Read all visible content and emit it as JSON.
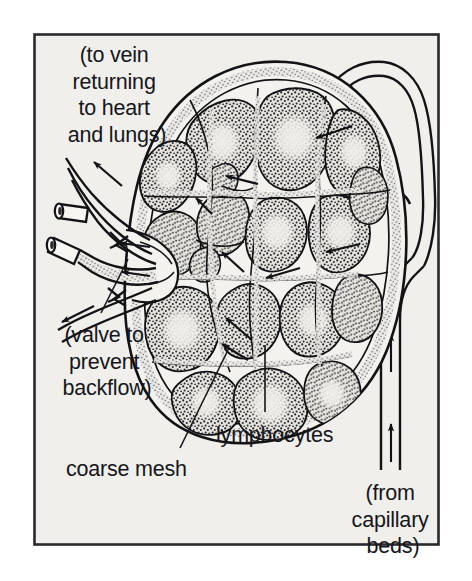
{
  "figure": {
    "frame": {
      "border_color": "#2a2a2e",
      "background_color": "#f0efec"
    },
    "colors": {
      "ink": "#16161a",
      "paper": "#f0efec",
      "stipple": "#2b2b2f",
      "nodule_fill": "#cfcdc8",
      "germinal_center": "#e8e7e3",
      "vessel_lumen": "#f6f5f2"
    }
  },
  "labels": {
    "efferent": {
      "name": "efferent-vessel-label",
      "lines": [
        "(to vein",
        "returning",
        "to heart",
        "and lungs)"
      ],
      "anchor_x": 117,
      "top_y": 45,
      "align": "middle"
    },
    "valve": {
      "name": "valve-label",
      "lines": [
        "(valve to",
        "prevent",
        "backflow)"
      ],
      "anchor_x": 107,
      "top_y": 325,
      "align": "middle"
    },
    "coarse_mesh": {
      "name": "coarse-mesh-label",
      "lines": [
        "coarse mesh"
      ],
      "anchor_x": 66,
      "top_y": 459,
      "align": "start"
    },
    "lymphocytes": {
      "name": "lymphocytes-label",
      "lines": [
        "lymphocytes"
      ],
      "anchor_x": 216,
      "top_y": 425,
      "align": "start"
    },
    "afferent": {
      "name": "afferent-vessel-label",
      "lines": [
        "(from",
        "capillary",
        "beds)"
      ],
      "anchor_x": 393,
      "top_y": 483,
      "align": "middle"
    }
  },
  "leader_lines": [
    {
      "name": "leader-valve",
      "from": [
        101,
        313
      ],
      "to": [
        128,
        259
      ]
    },
    {
      "name": "leader-coarse-mesh",
      "from": [
        180,
        448
      ],
      "to": [
        229,
        348
      ]
    },
    {
      "name": "leader-lymphocytes",
      "from": [
        265,
        412
      ],
      "to": [
        265,
        345
      ]
    }
  ],
  "flow": {
    "efferent_direction": "out-left",
    "afferent_direction": "in-from-right",
    "upward_arrow_count": 3,
    "note": "arrows in sinuses show lymph percolating from afferent vessels through the node toward the hilum and efferent vessel"
  },
  "structures": [
    {
      "name": "capsule",
      "description": "outer fibrous capsule of node"
    },
    {
      "name": "subcapsular-sinus",
      "description": "stippled channel just inside capsule"
    },
    {
      "name": "lymphoid-nodule",
      "description": "stippled lobule packed with lymphocytes",
      "count": 18
    },
    {
      "name": "germinal-center",
      "description": "pale center within nodule"
    },
    {
      "name": "medullary-sinus",
      "description": "branching white channel between nodules"
    },
    {
      "name": "hilum",
      "description": "indentation at left where efferent vessels exit"
    },
    {
      "name": "efferent-vessel",
      "description": "vessel leaving node to the left",
      "count": 2
    },
    {
      "name": "afferent-vessel",
      "description": "vessels entering node from the right",
      "count": 3
    },
    {
      "name": "valve",
      "description": "paired cusps preventing backflow",
      "count": 5
    },
    {
      "name": "cut-vessel-stub",
      "description": "vessel shown cut in cross-section",
      "count": 2
    }
  ]
}
